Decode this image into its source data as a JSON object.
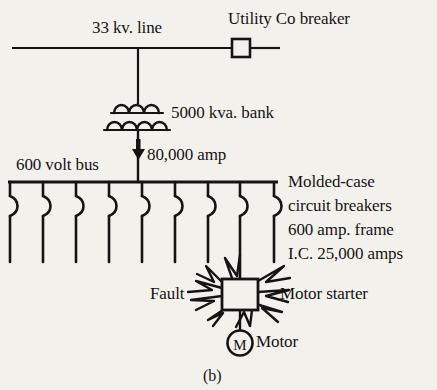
{
  "figure": {
    "caption": "(b)"
  },
  "colors": {
    "background": "#f3f1ec",
    "ink": "#141414"
  },
  "labels": {
    "hv_line": "33 kv. line",
    "utility_breaker": "Utility Co breaker",
    "transformer": "5000 kva. bank",
    "fault_current": "80,000 amp",
    "bus": "600 volt bus",
    "molded_case_line1": "Molded-case",
    "molded_case_line2": "circuit breakers",
    "molded_case_line3": "600 amp. frame",
    "molded_case_line4": "I.C. 25,000 amps",
    "fault": "Fault",
    "motor_starter": "Motor starter",
    "motor": "Motor",
    "motor_symbol": "M"
  },
  "symbols": {
    "utility_breaker_icon": "open-square-breaker-icon",
    "transformer_icon": "two-winding-transformer-icon",
    "current_arrow_icon": "down-arrow-icon",
    "bus_icon": "horizontal-bus-bar-icon",
    "breaker_drop_icon": "molded-case-circuit-breaker-icon",
    "starter_icon": "motor-starter-square-icon",
    "fault_icon": "fault-flash-burst-icon",
    "motor_icon": "motor-circle-icon"
  },
  "geometry": {
    "hv_line_y": 48,
    "bus_y": 182,
    "breaker_drop_count": 9,
    "breaker_drop_x": [
      10,
      43,
      76,
      109,
      142,
      175,
      208,
      240,
      274
    ],
    "breaker_drop_bottom": 262,
    "faulted_drop_index": 7,
    "transformer_x": 138,
    "starter_center_x": 240,
    "motor_center_y": 343
  }
}
